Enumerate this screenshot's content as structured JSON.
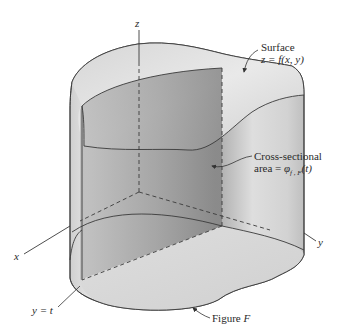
{
  "diagram": {
    "type": "3d-solid-cross-section",
    "axes": {
      "x": "x",
      "y": "y",
      "z": "z"
    },
    "labels": {
      "surface_line1": "Surface",
      "surface_line2": "z = f(x, y)",
      "cross_section_line1": "Cross-sectional",
      "cross_section_line2_prefix": "area = ",
      "cross_section_line2_expr": "φ",
      "cross_section_sub": "f , F",
      "cross_section_arg": "(t)",
      "plane": "y = t",
      "figure_prefix": "Figure ",
      "figure_name": "F"
    },
    "colors": {
      "background": "#ffffff",
      "outline": "#3a3a3a",
      "shade_light": "#e6e6e6",
      "shade_mid": "#bdbdbd",
      "shade_dark": "#8a8a8a",
      "text": "#2a2a2a"
    }
  }
}
